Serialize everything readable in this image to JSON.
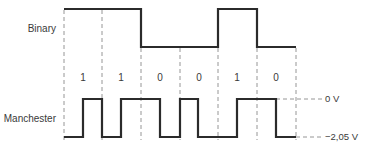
{
  "diagram": {
    "binary_label": "Binary",
    "manchester_label": "Manchester",
    "bits": [
      "1",
      "1",
      "0",
      "0",
      "1",
      "0"
    ],
    "voltage_high_label": "0 V",
    "voltage_low_label": "−2,05 V",
    "colors": {
      "waveform": "#2b2b2b",
      "gridline": "#8a8a8a",
      "text": "#3a3a3a",
      "background": "#ffffff"
    }
  }
}
